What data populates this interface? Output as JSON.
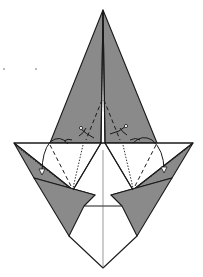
{
  "diagram": {
    "colors": {
      "colored_side": "#8a8a8a",
      "white_side": "#ffffff",
      "line": "#1a1a1a"
    },
    "symbols": {
      "valley_fold": "dashed line",
      "mountain_fold": "dotted line",
      "fold_arrow": "curved arrow",
      "unfold_arrow": "hollow arrowhead arrow"
    },
    "labels": []
  }
}
